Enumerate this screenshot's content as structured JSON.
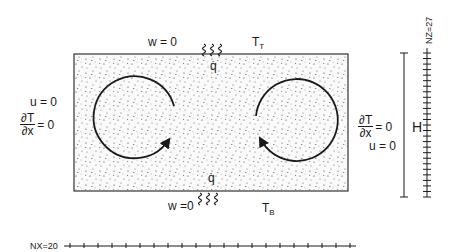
{
  "diagram": {
    "type": "rectangular cavity convection cell schematic",
    "top": {
      "bc": "w = 0",
      "temp_label": "T",
      "temp_sub": "T",
      "flux_label": "q̇"
    },
    "bottom": {
      "bc": "w =0",
      "temp_label": "T",
      "temp_sub": "B",
      "flux_label": "q̇"
    },
    "left": {
      "bc_u": "u = 0",
      "dT_num": "∂T",
      "dT_den": "∂x",
      "dT_eq": "= 0"
    },
    "right": {
      "bc_u": "u = 0",
      "dT_num": "∂T",
      "dT_den": "∂x",
      "dT_eq": "= 0"
    },
    "height_label": "H",
    "grid": {
      "nz_label": "NZ=27",
      "nz": 27,
      "nx_label": "NX=20",
      "nx": 20
    },
    "cells": [
      {
        "name": "left-cell",
        "rotation": "clockwise"
      },
      {
        "name": "right-cell",
        "rotation": "counterclockwise"
      }
    ]
  }
}
